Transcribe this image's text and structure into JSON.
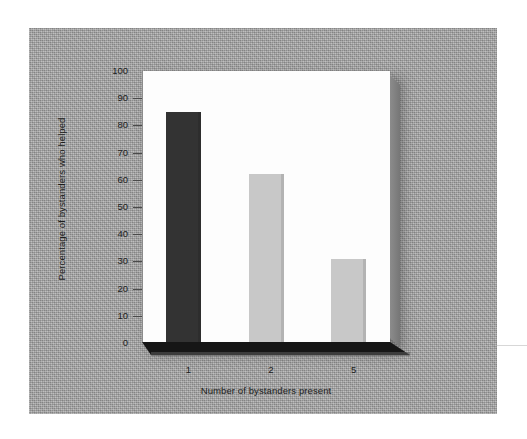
{
  "figure": {
    "backdrop_color": "#a9a9a9",
    "plate_color": "#fdfdfd",
    "floor_color": "#161616"
  },
  "chart_data": {
    "type": "bar",
    "title": "",
    "subtitle": "",
    "categories": [
      "1",
      "2",
      "5"
    ],
    "values": [
      85,
      62,
      31
    ],
    "series": [
      {
        "name": "Percentage of bystanders who helped",
        "values": [
          85,
          62,
          31
        ]
      }
    ],
    "bar_colors": [
      "#333333",
      "#c8c8c8",
      "#c8c8c8"
    ],
    "xlabel": "Number of bystanders present",
    "ylabel": "Percentage of bystanders who helped",
    "ylim": [
      0,
      100
    ],
    "ytick_step": 10,
    "yticks": [
      0,
      10,
      20,
      30,
      40,
      50,
      60,
      70,
      80,
      90,
      100
    ],
    "ytick_labels": [
      "0",
      "10",
      "20",
      "30",
      "40",
      "50",
      "60",
      "70",
      "80",
      "90",
      "100"
    ],
    "xtick_labels": [
      "1",
      "2",
      "5"
    ],
    "grid": false,
    "legend": false,
    "legend_position": "none",
    "annotations": []
  }
}
